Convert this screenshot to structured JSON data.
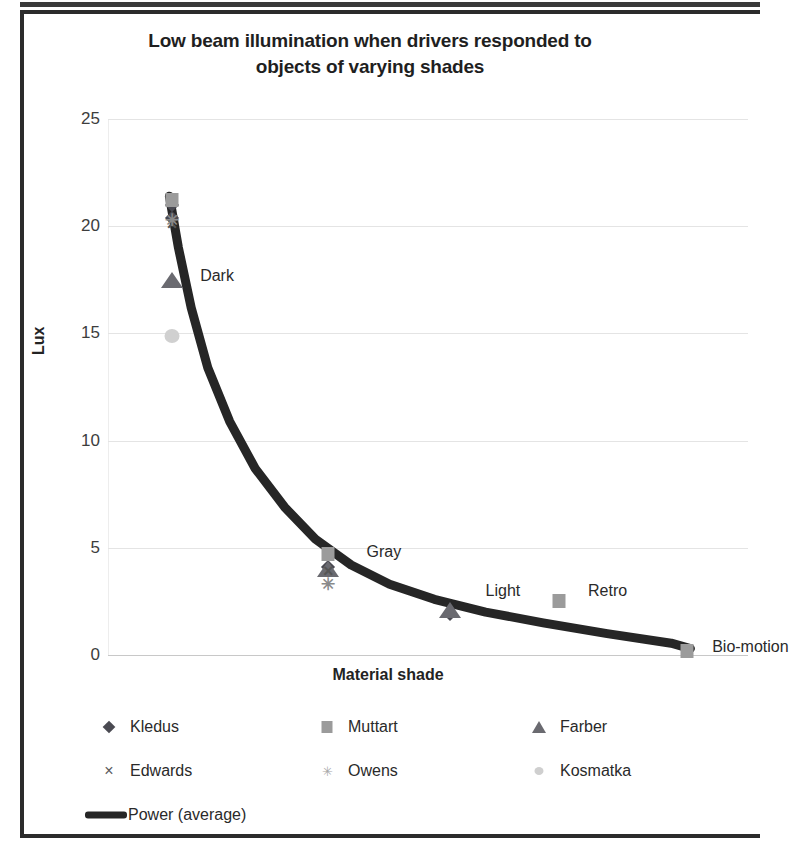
{
  "chart_data": {
    "type": "scatter",
    "title": "Low beam illumination when drivers responded to objects of varying shades",
    "title_line1": "Low beam illumination when drivers responded to",
    "title_line2": "objects of varying shades",
    "xlabel": "Material shade",
    "ylabel": "Lux",
    "ylim": [
      0,
      25
    ],
    "yticks": [
      25,
      20,
      15,
      10,
      5,
      0
    ],
    "xlim": [
      0,
      5
    ],
    "grid": true,
    "legend_position": "bottom",
    "categories": [
      "Dark",
      "Gray",
      "Light",
      "Retro",
      "Bio-motion"
    ],
    "annotations": [
      {
        "text": "Dark",
        "x": 0.72,
        "y": 17.6
      },
      {
        "text": "Gray",
        "x": 2.02,
        "y": 4.7
      },
      {
        "text": "Light",
        "x": 2.95,
        "y": 2.9
      },
      {
        "text": "Retro",
        "x": 3.75,
        "y": 2.9
      },
      {
        "text": "Bio-motion",
        "x": 4.72,
        "y": 0.3
      }
    ],
    "series": [
      {
        "name": "Kledus",
        "marker": "diamond",
        "color": "#4a4a52",
        "points": [
          {
            "x": 0.5,
            "y": 21.0
          },
          {
            "x": 0.5,
            "y": 20.4
          },
          {
            "x": 1.72,
            "y": 4.1
          },
          {
            "x": 2.67,
            "y": 1.9
          }
        ]
      },
      {
        "name": "Muttart",
        "marker": "square",
        "color": "#9b9b9b",
        "points": [
          {
            "x": 0.5,
            "y": 21.2
          },
          {
            "x": 1.72,
            "y": 4.7
          },
          {
            "x": 3.52,
            "y": 2.5
          },
          {
            "x": 4.52,
            "y": 0.2
          }
        ]
      },
      {
        "name": "Farber",
        "marker": "triangle",
        "color": "#6a6a70",
        "points": [
          {
            "x": 0.5,
            "y": 17.5
          },
          {
            "x": 2.67,
            "y": 2.1
          },
          {
            "x": 1.72,
            "y": 4.0
          }
        ]
      },
      {
        "name": "Edwards",
        "marker": "cross",
        "color": "#555555",
        "points": [
          {
            "x": 0.5,
            "y": 20.1
          },
          {
            "x": 1.72,
            "y": 3.9
          }
        ]
      },
      {
        "name": "Owens",
        "marker": "asterisk",
        "color": "#8a8a8a",
        "points": [
          {
            "x": 0.5,
            "y": 20.3
          },
          {
            "x": 1.72,
            "y": 3.3
          }
        ]
      },
      {
        "name": "Kosmatka",
        "marker": "circle",
        "color": "#d0d0d0",
        "points": [
          {
            "x": 0.5,
            "y": 14.9
          }
        ]
      }
    ],
    "trendline": {
      "name": "Power (average)",
      "type": "power",
      "color": "#262626",
      "width": 9,
      "points": [
        {
          "x": 0.48,
          "y": 21.4
        },
        {
          "x": 0.55,
          "y": 19.0
        },
        {
          "x": 0.65,
          "y": 16.2
        },
        {
          "x": 0.78,
          "y": 13.4
        },
        {
          "x": 0.95,
          "y": 10.9
        },
        {
          "x": 1.15,
          "y": 8.7
        },
        {
          "x": 1.38,
          "y": 6.9
        },
        {
          "x": 1.62,
          "y": 5.4
        },
        {
          "x": 1.9,
          "y": 4.2
        },
        {
          "x": 2.2,
          "y": 3.3
        },
        {
          "x": 2.55,
          "y": 2.6
        },
        {
          "x": 2.95,
          "y": 2.0
        },
        {
          "x": 3.4,
          "y": 1.5
        },
        {
          "x": 3.9,
          "y": 1.0
        },
        {
          "x": 4.4,
          "y": 0.55
        },
        {
          "x": 4.55,
          "y": 0.3
        }
      ]
    }
  },
  "legend": {
    "items": [
      {
        "label": "Kledus",
        "marker": "diamond",
        "icon": "diamond-marker-icon"
      },
      {
        "label": "Muttart",
        "marker": "square",
        "icon": "square-marker-icon"
      },
      {
        "label": "Farber",
        "marker": "triangle",
        "icon": "triangle-marker-icon"
      },
      {
        "label": "Edwards",
        "marker": "cross",
        "icon": "cross-marker-icon"
      },
      {
        "label": "Owens",
        "marker": "asterisk",
        "icon": "asterisk-marker-icon"
      },
      {
        "label": "Kosmatka",
        "marker": "circle",
        "icon": "circle-marker-icon"
      },
      {
        "label": "Power (average)",
        "marker": "line",
        "icon": "line-swatch-icon"
      }
    ],
    "cross_glyph": "×",
    "asterisk_glyph": "✳"
  }
}
